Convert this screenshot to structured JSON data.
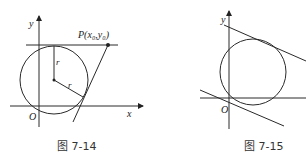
{
  "figures": [
    {
      "id": "fig-7-14",
      "caption": "图 7-14",
      "axis_labels": {
        "x": "x",
        "y": "y",
        "origin": "O"
      },
      "point_label": {
        "name": "P",
        "text": "P(x₀,y₀)"
      },
      "radius_labels": [
        "r",
        "r"
      ],
      "elements": {
        "circle": {
          "cx": 54,
          "cy": 80,
          "r": 34
        },
        "horizontal_tangent": {
          "y": 45
        },
        "tangent_from_P": {
          "from": [
            108,
            45
          ],
          "to": [
            73,
            122
          ]
        }
      }
    },
    {
      "id": "fig-7-15",
      "caption": "图 7-15",
      "axis_labels": {
        "y": "y",
        "origin": "O"
      },
      "elements": {
        "circle": {
          "cx": 253,
          "cy": 72,
          "r": 33
        },
        "upper_tangent": {
          "from": [
            224,
            25
          ],
          "to": [
            306,
            61
          ]
        },
        "lower_tangent": {
          "from": [
            200,
            90
          ],
          "to": [
            284,
            126
          ]
        }
      }
    }
  ]
}
